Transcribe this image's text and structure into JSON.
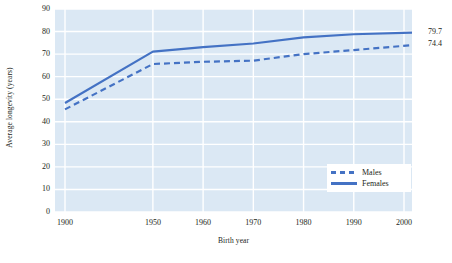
{
  "chart_data": {
    "type": "line",
    "title": "",
    "xlabel": "Birth year",
    "ylabel": "Average longevity (years)",
    "x": [
      1900,
      1950,
      1960,
      1970,
      1980,
      1990,
      2004
    ],
    "xtick_labels": [
      "1900",
      "1950",
      "1960",
      "1970",
      "1980",
      "1990",
      "2000"
    ],
    "xticks": [
      1900,
      1950,
      1960,
      1970,
      1980,
      1990,
      2000
    ],
    "ylim": [
      0,
      90
    ],
    "yticks": [
      0,
      10,
      20,
      30,
      40,
      50,
      60,
      70,
      80,
      90
    ],
    "ytick_labels": [
      "0",
      "10",
      "20",
      "30",
      "40",
      "50",
      "60",
      "70",
      "80",
      "90"
    ],
    "grid": true,
    "legend_position": "bottom-right",
    "series": [
      {
        "name": "Males",
        "style": "dashed",
        "color": "#4472c4",
        "values": [
          45.5,
          65.6,
          66.6,
          67.1,
          70.0,
          71.8,
          74.4
        ],
        "end_label": "74.4"
      },
      {
        "name": "Females",
        "style": "solid",
        "color": "#4472c4",
        "values": [
          48.3,
          71.1,
          73.1,
          74.7,
          77.4,
          78.8,
          79.7
        ],
        "end_label": "79.7"
      }
    ],
    "annotations": [
      {
        "text": "79.7",
        "series": "Females"
      },
      {
        "text": "74.4",
        "series": "Males"
      }
    ],
    "plot_background": "#dbe8f4",
    "grid_color": "#ffffff"
  },
  "legend": {
    "items": [
      {
        "label": "Males"
      },
      {
        "label": "Females"
      }
    ]
  }
}
